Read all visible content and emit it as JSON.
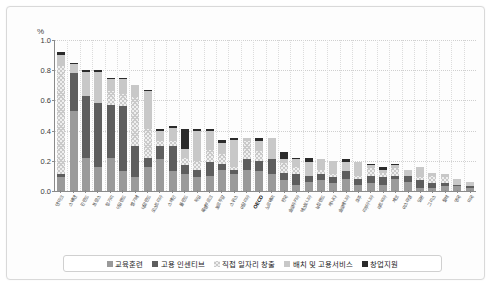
{
  "axis": {
    "unit_label": "%",
    "y_ticks": [
      "0.0",
      "0.2",
      "0.4",
      "0.6",
      "0.8",
      "1.0"
    ]
  },
  "legend": {
    "items": [
      {
        "label": "교육훈련",
        "key": "s0",
        "color": "#9a9a9a"
      },
      {
        "label": "고용 인센티브",
        "key": "s1",
        "color": "#5e5e5e"
      },
      {
        "label": "직접 일자리 창출",
        "key": "s2",
        "color": "#efefef"
      },
      {
        "label": "배치 및 고용서비스",
        "key": "s3",
        "color": "#c8c8c8"
      },
      {
        "label": "창업지원",
        "key": "s4",
        "color": "#2b2b2b"
      }
    ]
  },
  "chart_data": {
    "type": "bar",
    "stacked": true,
    "title": "",
    "xlabel": "",
    "ylabel": "%",
    "ylim": [
      0.0,
      1.0
    ],
    "ytick_step": 0.2,
    "grid": true,
    "legend_position": "bottom",
    "categories": [
      "덴마크",
      "스웨덴",
      "핀란드",
      "프랑스",
      "헝가리",
      "아일랜드",
      "벨기에",
      "네덜란드",
      "오스트리아",
      "스페인",
      "폴란드",
      "독일",
      "룩셈부르크",
      "포르투갈",
      "스위스",
      "이탈리아",
      "OECD",
      "노르웨이",
      "한국",
      "슬로바키아",
      "에스토니아",
      "뉴질랜드",
      "캐나다",
      "슬로베니아",
      "호주",
      "리투아니아",
      "라트비아",
      "체코",
      "이스라엘",
      "일본",
      "그리스",
      "칠레",
      "영국",
      "미국"
    ],
    "series": [
      {
        "name": "교육훈련",
        "values": [
          0.09,
          0.53,
          0.22,
          0.16,
          0.22,
          0.13,
          0.09,
          0.16,
          0.21,
          0.13,
          0.11,
          0.09,
          0.1,
          0.14,
          0.11,
          0.14,
          0.13,
          0.11,
          0.07,
          0.04,
          0.06,
          0.07,
          0.05,
          0.08,
          0.04,
          0.05,
          0.04,
          0.08,
          0.06,
          0.02,
          0.02,
          0.03,
          0.03,
          0.02
        ]
      },
      {
        "name": "고용 인센티브",
        "values": [
          0.02,
          0.25,
          0.41,
          0.42,
          0.35,
          0.43,
          0.21,
          0.06,
          0.09,
          0.17,
          0.06,
          0.05,
          0.09,
          0.04,
          0.03,
          0.07,
          0.07,
          0.1,
          0.05,
          0.07,
          0.04,
          0.04,
          0.04,
          0.05,
          0.04,
          0.05,
          0.05,
          0.02,
          0.04,
          0.05,
          0.03,
          0.02,
          0.01,
          0.01
        ]
      },
      {
        "name": "직접 일자리 창출",
        "values": [
          0.72,
          0.0,
          0.0,
          0.0,
          0.09,
          0.09,
          0.32,
          0.19,
          0.03,
          0.03,
          0.05,
          0.06,
          0.08,
          0.07,
          0.02,
          0.12,
          0.07,
          0.0,
          0.07,
          0.05,
          0.0,
          0.03,
          0.02,
          0.0,
          0.02,
          0.05,
          0.03,
          0.05,
          0.0,
          0.02,
          0.05,
          0.04,
          0.0,
          0.0
        ]
      },
      {
        "name": "배치 및 고용서비스",
        "values": [
          0.07,
          0.06,
          0.16,
          0.21,
          0.08,
          0.09,
          0.08,
          0.25,
          0.07,
          0.09,
          0.06,
          0.2,
          0.13,
          0.07,
          0.18,
          0.02,
          0.06,
          0.14,
          0.02,
          0.05,
          0.09,
          0.07,
          0.09,
          0.06,
          0.09,
          0.02,
          0.02,
          0.02,
          0.04,
          0.07,
          0.02,
          0.02,
          0.04,
          0.03
        ]
      },
      {
        "name": "창업지원",
        "values": [
          0.02,
          0.01,
          0.01,
          0.01,
          0.01,
          0.01,
          0.0,
          0.01,
          0.01,
          0.01,
          0.13,
          0.01,
          0.01,
          0.02,
          0.01,
          0.0,
          0.02,
          0.0,
          0.05,
          0.01,
          0.03,
          0.0,
          0.0,
          0.02,
          0.0,
          0.01,
          0.02,
          0.01,
          0.0,
          0.0,
          0.0,
          0.0,
          0.0,
          0.0
        ]
      }
    ],
    "totals": [
      0.92,
      0.85,
      0.8,
      0.8,
      0.75,
      0.75,
      0.7,
      0.67,
      0.41,
      0.43,
      0.41,
      0.41,
      0.41,
      0.34,
      0.35,
      0.35,
      0.35,
      0.35,
      0.26,
      0.22,
      0.22,
      0.21,
      0.2,
      0.21,
      0.19,
      0.18,
      0.16,
      0.18,
      0.14,
      0.16,
      0.12,
      0.11,
      0.08,
      0.06
    ]
  }
}
